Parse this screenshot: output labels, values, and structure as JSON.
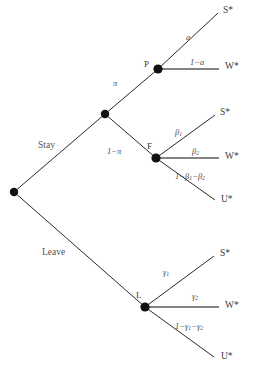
{
  "figure": {
    "type": "decision-tree",
    "width": 259,
    "height": 372,
    "background": "#ffffff",
    "line_color": "#2a2a2a",
    "node_color": "#111111",
    "text_color": "#4a4a4a"
  },
  "nodes": {
    "root": {
      "label": "",
      "x": 14,
      "y": 192
    },
    "chance": {
      "label": "",
      "x": 105,
      "y": 114
    },
    "p": {
      "label": "P",
      "x": 158,
      "y": 69,
      "label_x": 144,
      "label_y": 60
    },
    "f": {
      "label": "F",
      "x": 156,
      "y": 158,
      "label_x": 147,
      "label_y": 142
    },
    "l": {
      "label": "L",
      "x": 145,
      "y": 307,
      "label_x": 136,
      "label_y": 291
    }
  },
  "choices": {
    "stay": {
      "label": "Stay",
      "x": 38,
      "y": 141
    },
    "leave": {
      "label": "Leave",
      "x": 42,
      "y": 248
    }
  },
  "probabilities": {
    "pi": {
      "label": "π",
      "x": 113,
      "y": 79
    },
    "one_minus_pi": {
      "label": "1−π",
      "x": 107,
      "y": 147
    },
    "a": {
      "label": "a",
      "x": 186,
      "y": 33
    },
    "one_minus_a": {
      "label": "1−a",
      "x": 190,
      "y": 58
    },
    "beta1": {
      "label": "β1",
      "x": 175,
      "y": 128
    },
    "beta2": {
      "label": "β2",
      "x": 192,
      "y": 147
    },
    "one_minus_beta": {
      "label": "1−β1−β2",
      "x": 175,
      "y": 172
    },
    "gamma1": {
      "label": "γ1",
      "x": 163,
      "y": 268
    },
    "gamma2": {
      "label": "γ2",
      "x": 192,
      "y": 292
    },
    "one_minus_gamma": {
      "label": "1−γ1−γ2",
      "x": 175,
      "y": 322
    }
  },
  "outcomes": {
    "p_success": {
      "label": "S*",
      "x": 223,
      "y": 6
    },
    "p_wait": {
      "label": "W*",
      "x": 225,
      "y": 62
    },
    "f_success": {
      "label": "S*",
      "x": 220,
      "y": 108
    },
    "f_wait": {
      "label": "W*",
      "x": 225,
      "y": 152
    },
    "f_unemployed": {
      "label": "U*",
      "x": 221,
      "y": 195
    },
    "l_success": {
      "label": "S*",
      "x": 220,
      "y": 249
    },
    "l_wait": {
      "label": "W*",
      "x": 225,
      "y": 301
    },
    "l_unemployed": {
      "label": "U*",
      "x": 221,
      "y": 352
    }
  },
  "edges": [
    {
      "name": "root-to-chance",
      "from": "root",
      "to": "chance",
      "x1": 14,
      "y1": 192,
      "x2": 105,
      "y2": 114
    },
    {
      "name": "root-to-leave",
      "from": "root",
      "to": "l",
      "x1": 14,
      "y1": 192,
      "x2": 145,
      "y2": 307
    },
    {
      "name": "chance-to-p",
      "from": "chance",
      "to": "p",
      "x1": 105,
      "y1": 114,
      "x2": 158,
      "y2": 69
    },
    {
      "name": "chance-to-f",
      "from": "chance",
      "to": "f",
      "x1": 105,
      "y1": 114,
      "x2": 156,
      "y2": 158
    },
    {
      "name": "p-to-success",
      "from": "p",
      "to": "p_success",
      "x1": 158,
      "y1": 69,
      "x2": 218,
      "y2": 13
    },
    {
      "name": "p-to-wait",
      "from": "p",
      "to": "p_wait",
      "x1": 158,
      "y1": 69,
      "x2": 219,
      "y2": 69,
      "flat": true
    },
    {
      "name": "f-to-success",
      "from": "f",
      "to": "f_success",
      "x1": 156,
      "y1": 158,
      "x2": 215,
      "y2": 115
    },
    {
      "name": "f-to-wait",
      "from": "f",
      "to": "f_wait",
      "x1": 156,
      "y1": 158,
      "x2": 219,
      "y2": 158,
      "flat": true
    },
    {
      "name": "f-to-unemployed",
      "from": "f",
      "to": "f_unemployed",
      "x1": 156,
      "y1": 158,
      "x2": 215,
      "y2": 200
    },
    {
      "name": "l-to-success",
      "from": "l",
      "to": "l_success",
      "x1": 145,
      "y1": 307,
      "x2": 214,
      "y2": 256
    },
    {
      "name": "l-to-wait",
      "from": "l",
      "to": "l_wait",
      "x1": 145,
      "y1": 307,
      "x2": 219,
      "y2": 307,
      "flat": true
    },
    {
      "name": "l-to-unemployed",
      "from": "l",
      "to": "l_unemployed",
      "x1": 145,
      "y1": 307,
      "x2": 214,
      "y2": 357
    }
  ]
}
